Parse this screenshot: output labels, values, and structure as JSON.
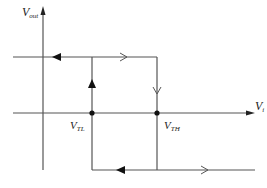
{
  "diagram": {
    "y_axis_label": "V",
    "y_axis_sub": "out",
    "x_axis_label": "V",
    "x_axis_sub": "i",
    "threshold_low_label": "V",
    "threshold_low_sub": "TL",
    "threshold_high_label": "V",
    "threshold_high_sub": "TH",
    "colors": {
      "line": "#555555",
      "arrow": "#111111",
      "background": "#ffffff"
    }
  }
}
